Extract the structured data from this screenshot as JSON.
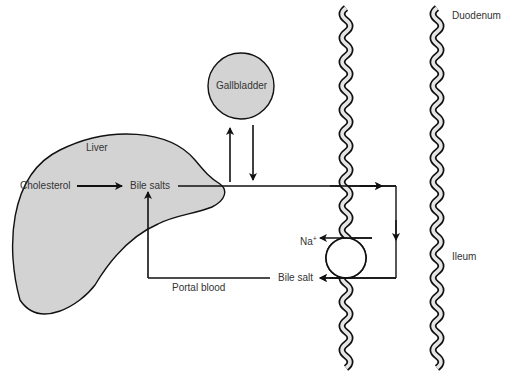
{
  "diagram": {
    "labels": {
      "liver": "Liver",
      "cholesterol": "Cholesterol",
      "bile_salts": "Bile salts",
      "gallbladder": "Gallbladder",
      "duodenum": "Duodenum",
      "ileum": "Ileum",
      "na": "Na",
      "na_charge": "+",
      "bile_salt": "Bile salt",
      "portal_blood": "Portal blood"
    },
    "colors": {
      "organ_fill": "#d3d3d3",
      "stroke": "#111111",
      "text": "#333333",
      "wall_inner": "#e6e6e6"
    }
  }
}
